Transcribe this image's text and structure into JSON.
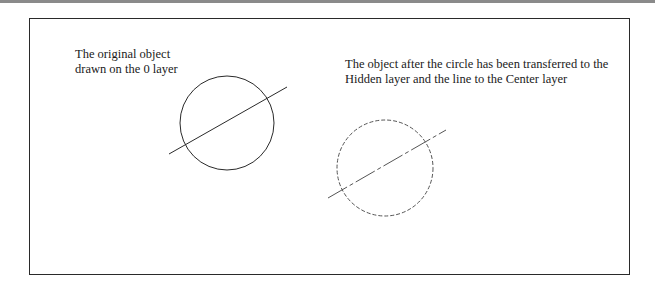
{
  "labels": {
    "original_line1": "The original object",
    "original_line2": "drawn on the 0 layer",
    "after_line1": "The object after the circle has been transferred to the",
    "after_line2": "Hidden layer and the line to the Center layer"
  },
  "objects": [
    {
      "name": "original",
      "layer_circle": "0",
      "layer_line": "0",
      "circle": {
        "cx": 227,
        "cy": 123,
        "r": 47
      },
      "line": {
        "x1": 169,
        "y1": 154,
        "x2": 287,
        "y2": 87
      }
    },
    {
      "name": "transferred",
      "layer_circle": "Hidden",
      "layer_line": "Center",
      "circle": {
        "cx": 385,
        "cy": 168,
        "r": 48
      },
      "line": {
        "x1": 328,
        "y1": 198,
        "x2": 446,
        "y2": 130
      }
    }
  ]
}
